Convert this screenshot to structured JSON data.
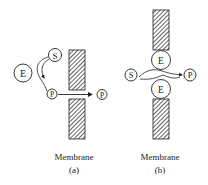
{
  "panel_a": {
    "enzyme_label": "E",
    "substrate_label": "S",
    "product_label": "P",
    "product_out_label": "P",
    "membrane_label": "Membrane",
    "caption": "(a)"
  },
  "panel_b": {
    "enzyme_top_label": "E",
    "enzyme_bottom_label": "E",
    "substrate_label": "S",
    "product_label": "P",
    "membrane_label": "Membrane",
    "caption": "(b)"
  },
  "colors": {
    "stroke": "#222222",
    "hatch": "#333333",
    "background": "#ffffff"
  }
}
